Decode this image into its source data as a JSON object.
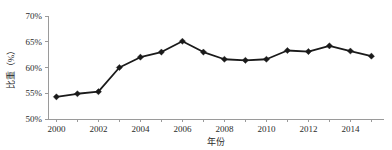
{
  "chart_data": {
    "type": "line",
    "title": "",
    "xlabel": "年份",
    "ylabel": "比重（%）",
    "x": [
      2000,
      2001,
      2002,
      2003,
      2004,
      2005,
      2006,
      2007,
      2008,
      2009,
      2010,
      2011,
      2012,
      2013,
      2014,
      2015
    ],
    "values": [
      54.3,
      54.9,
      55.3,
      60.0,
      62.0,
      63.0,
      65.1,
      63.0,
      61.6,
      61.4,
      61.6,
      63.3,
      63.1,
      64.2,
      63.2,
      62.2
    ],
    "series": [
      {
        "name": "比重（%）",
        "values": [
          54.3,
          54.9,
          55.3,
          60.0,
          62.0,
          63.0,
          65.1,
          63.0,
          61.6,
          61.4,
          61.6,
          63.3,
          63.1,
          64.2,
          63.2,
          62.2
        ]
      }
    ],
    "xlim": [
      1999.6,
      2015.6
    ],
    "ylim": [
      50,
      70
    ],
    "y_ticks": [
      50,
      55,
      60,
      65,
      70
    ],
    "y_tick_labels": [
      "50%",
      "55%",
      "60%",
      "65%",
      "70%"
    ],
    "x_ticks": [
      2000,
      2002,
      2004,
      2006,
      2008,
      2010,
      2012,
      2014
    ],
    "x_tick_labels": [
      "2000",
      "2002",
      "2004",
      "2006",
      "2008",
      "2010",
      "2012",
      "2014"
    ],
    "grid": false,
    "legend": false,
    "marker": "diamond",
    "line_color": "#1a1a1a",
    "marker_color": "#1a1a1a",
    "axis_color": "#9a9a9a",
    "background": "#ffffff"
  }
}
